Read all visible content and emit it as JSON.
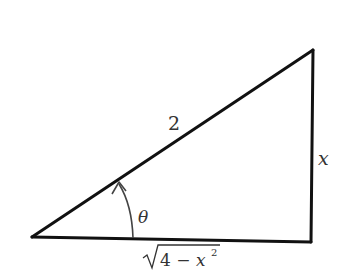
{
  "diagram": {
    "type": "right-triangle",
    "vertices": {
      "left": [
        32,
        237
      ],
      "top_right": [
        313,
        50
      ],
      "bottom_right": [
        311,
        242
      ]
    },
    "labels": {
      "hypotenuse": "2",
      "opposite": "x",
      "adjacent_radicand": "4 − x",
      "adjacent_exponent": "2",
      "angle": "θ"
    },
    "colors": {
      "stroke": "#111111",
      "arc": "#444444",
      "text": "#333333",
      "background": "#ffffff"
    }
  }
}
